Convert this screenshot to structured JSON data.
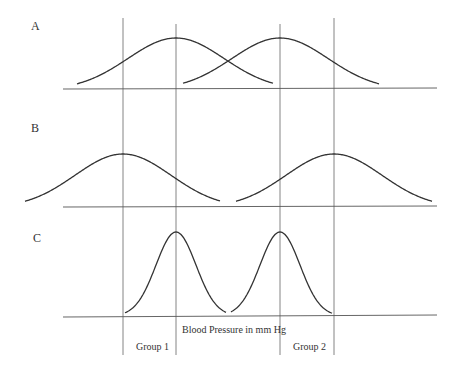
{
  "panels": [
    {
      "label": "A"
    },
    {
      "label": "B"
    },
    {
      "label": "C"
    }
  ],
  "axis_label": "Blood Pressure in mm Hg",
  "groups": [
    {
      "label": "Group 1"
    },
    {
      "label": "Group 2"
    }
  ],
  "colors": {
    "line": "#555555",
    "curve": "#333333",
    "text": "#333333"
  },
  "chart_data": {
    "type": "line",
    "title": "",
    "xlabel": "Blood Pressure in mm Hg",
    "ylabel": "",
    "panels": [
      {
        "name": "A",
        "note": "Overlapping distributions, moderate spread; means close together",
        "series": [
          {
            "name": "Group 1",
            "mean_x": 176
          },
          {
            "name": "Group 2",
            "mean_x": 280
          }
        ]
      },
      {
        "name": "B",
        "note": "Means far apart, wide spread",
        "series": [
          {
            "name": "Group 1",
            "mean_x": 123
          },
          {
            "name": "Group 2",
            "mean_x": 334
          }
        ]
      },
      {
        "name": "C",
        "note": "Means close together, narrow spread",
        "series": [
          {
            "name": "Group 1",
            "mean_x": 176
          },
          {
            "name": "Group 2",
            "mean_x": 280
          }
        ]
      }
    ],
    "legend": [
      "Group 1",
      "Group 2"
    ]
  }
}
